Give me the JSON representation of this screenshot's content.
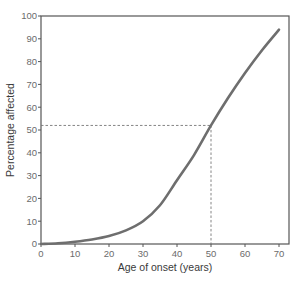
{
  "chart_data": {
    "type": "line",
    "title": "",
    "xlabel": "Age of onset (years)",
    "ylabel": "Percentage affected",
    "xlim": [
      0,
      70
    ],
    "ylim": [
      0,
      100
    ],
    "xticks": [
      0,
      10,
      20,
      30,
      40,
      50,
      60,
      70
    ],
    "yticks": [
      0,
      10,
      20,
      30,
      40,
      50,
      60,
      70,
      80,
      90,
      100
    ],
    "grid": false,
    "legend": null,
    "series": [
      {
        "name": "Cumulative percentage affected",
        "color": "#6e6e6e",
        "x": [
          0,
          5,
          10,
          15,
          20,
          25,
          30,
          35,
          40,
          45,
          50,
          55,
          60,
          65,
          70
        ],
        "y": [
          0,
          0.3,
          1,
          2,
          3.5,
          6,
          10,
          17,
          28,
          39,
          52,
          64,
          75,
          85,
          94
        ]
      }
    ],
    "annotations": [
      {
        "type": "dashed-reference",
        "x": 50,
        "y": 52,
        "description": "Dashed lines from x=50 up to curve and across to y-axis at ~52%"
      }
    ]
  },
  "colors": {
    "curve": "#6e6e6e",
    "axis": "#555555",
    "dashed": "#777777",
    "text": "#6b6b6b"
  }
}
